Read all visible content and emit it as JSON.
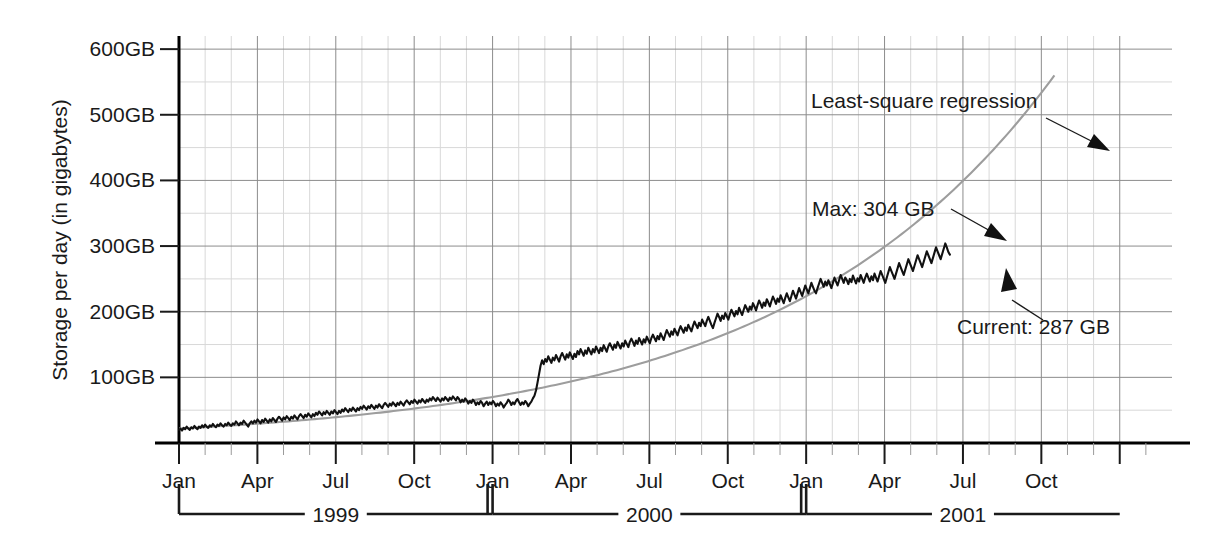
{
  "chart_data": {
    "type": "line",
    "title": "",
    "xlabel": "",
    "ylabel": "Storage per day (in gigabytes)",
    "ylim": [
      0,
      620
    ],
    "xlim": [
      0,
      38
    ],
    "grid": "major and minor gridlines",
    "legend_position": "inline annotations",
    "y_ticks": [
      {
        "value": 100,
        "label": "100GB"
      },
      {
        "value": 200,
        "label": "200GB"
      },
      {
        "value": 300,
        "label": "300GB"
      },
      {
        "value": 400,
        "label": "400GB"
      },
      {
        "value": 500,
        "label": "500GB"
      },
      {
        "value": 600,
        "label": "600GB"
      }
    ],
    "y_minor_ticks": [
      50,
      150,
      250,
      350,
      450,
      550
    ],
    "x_ticks": [
      {
        "index": 0,
        "label": "Jan",
        "year": 1999
      },
      {
        "index": 3,
        "label": "Apr",
        "year": 1999
      },
      {
        "index": 6,
        "label": "Jul",
        "year": 1999
      },
      {
        "index": 9,
        "label": "Oct",
        "year": 1999
      },
      {
        "index": 12,
        "label": "Jan",
        "year": 2000
      },
      {
        "index": 15,
        "label": "Apr",
        "year": 2000
      },
      {
        "index": 18,
        "label": "Jul",
        "year": 2000
      },
      {
        "index": 21,
        "label": "Oct",
        "year": 2000
      },
      {
        "index": 24,
        "label": "Jan",
        "year": 2001
      },
      {
        "index": 27,
        "label": "Apr",
        "year": 2001
      },
      {
        "index": 30,
        "label": "Jul",
        "year": 2001
      },
      {
        "index": 33,
        "label": "Oct",
        "year": 2001
      }
    ],
    "year_brackets": [
      {
        "label": "1999",
        "start_index": 0,
        "end_index": 12
      },
      {
        "label": "2000",
        "start_index": 12,
        "end_index": 24
      },
      {
        "label": "2001",
        "start_index": 24,
        "end_index": 36
      }
    ],
    "series": [
      {
        "name": "Storage per day",
        "style": "noisy black line",
        "color": "#111111",
        "values": [
          20,
          22,
          19,
          23,
          21,
          25,
          22,
          20,
          24,
          22,
          26,
          23,
          21,
          25,
          23,
          27,
          24,
          28,
          25,
          23,
          27,
          25,
          29,
          26,
          24,
          28,
          26,
          30,
          27,
          25,
          29,
          27,
          31,
          28,
          26,
          30,
          28,
          33,
          30,
          27,
          31,
          29,
          34,
          31,
          28,
          25,
          30,
          33,
          30,
          34,
          31,
          36,
          33,
          30,
          35,
          32,
          37,
          34,
          31,
          36,
          33,
          38,
          35,
          32,
          37,
          40,
          37,
          34,
          39,
          36,
          41,
          38,
          35,
          40,
          37,
          42,
          39,
          36,
          41,
          44,
          41,
          38,
          43,
          40,
          45,
          42,
          39,
          44,
          41,
          46,
          43,
          48,
          45,
          42,
          47,
          44,
          49,
          46,
          43,
          48,
          45,
          50,
          47,
          44,
          49,
          46,
          51,
          48,
          53,
          50,
          47,
          52,
          49,
          54,
          51,
          48,
          53,
          50,
          55,
          52,
          57,
          54,
          51,
          56,
          53,
          58,
          55,
          52,
          57,
          54,
          59,
          56,
          53,
          58,
          61,
          58,
          55,
          60,
          57,
          62,
          59,
          56,
          61,
          58,
          63,
          60,
          57,
          62,
          65,
          62,
          59,
          64,
          61,
          66,
          63,
          60,
          65,
          62,
          67,
          64,
          61,
          66,
          63,
          68,
          65,
          70,
          67,
          64,
          69,
          66,
          63,
          68,
          65,
          70,
          67,
          64,
          69,
          66,
          71,
          68,
          65,
          70,
          67,
          62,
          66,
          63,
          68,
          65,
          60,
          64,
          61,
          66,
          63,
          58,
          62,
          59,
          64,
          61,
          56,
          60,
          63,
          58,
          62,
          59,
          64,
          61,
          56,
          60,
          57,
          62,
          59,
          54,
          58,
          61,
          66,
          63,
          58,
          62,
          59,
          64,
          67,
          62,
          58,
          62,
          59,
          64,
          61,
          56,
          60,
          63,
          68,
          72,
          80,
          92,
          105,
          118,
          126,
          120,
          128,
          124,
          132,
          127,
          122,
          130,
          126,
          134,
          129,
          124,
          132,
          137,
          132,
          127,
          135,
          130,
          138,
          133,
          128,
          136,
          131,
          140,
          135,
          143,
          138,
          133,
          141,
          136,
          145,
          140,
          135,
          143,
          138,
          147,
          142,
          137,
          145,
          140,
          149,
          144,
          139,
          147,
          152,
          147,
          142,
          150,
          145,
          154,
          149,
          144,
          152,
          147,
          156,
          151,
          146,
          154,
          159,
          154,
          148,
          156,
          151,
          160,
          155,
          150,
          158,
          153,
          162,
          157,
          152,
          160,
          165,
          160,
          155,
          163,
          158,
          167,
          162,
          157,
          165,
          172,
          167,
          162,
          170,
          165,
          174,
          169,
          164,
          172,
          178,
          173,
          168,
          176,
          171,
          180,
          175,
          170,
          178,
          185,
          180,
          175,
          183,
          178,
          188,
          183,
          178,
          186,
          192,
          186,
          180,
          175,
          183,
          190,
          197,
          192,
          186,
          194,
          189,
          198,
          193,
          188,
          196,
          203,
          198,
          193,
          201,
          196,
          206,
          200,
          195,
          203,
          210,
          205,
          200,
          208,
          203,
          213,
          208,
          202,
          210,
          217,
          212,
          206,
          214,
          209,
          219,
          214,
          208,
          216,
          223,
          218,
          212,
          220,
          215,
          225,
          219,
          213,
          221,
          228,
          222,
          216,
          224,
          232,
          226,
          220,
          228,
          236,
          230,
          224,
          232,
          240,
          234,
          228,
          236,
          244,
          238,
          232,
          228,
          236,
          243,
          250,
          244,
          238,
          246,
          240,
          248,
          242,
          236,
          244,
          252,
          246,
          240,
          248,
          256,
          250,
          244,
          252,
          248,
          242,
          250,
          245,
          255,
          249,
          243,
          251,
          246,
          256,
          250,
          244,
          252,
          258,
          252,
          246,
          254,
          248,
          258,
          252,
          246,
          254,
          262,
          256,
          250,
          244,
          252,
          260,
          268,
          262,
          256,
          250,
          258,
          266,
          274,
          268,
          262,
          256,
          264,
          272,
          280,
          274,
          268,
          262,
          270,
          278,
          286,
          280,
          274,
          268,
          276,
          284,
          292,
          286,
          280,
          274,
          282,
          290,
          298,
          292,
          286,
          280,
          288,
          296,
          304,
          298,
          291,
          287
        ]
      },
      {
        "name": "Least-square regression",
        "style": "smooth grey curve",
        "color": "#9d9d9d",
        "description": "exponential fit rising from ~22GB at Jan 1999 to ~560GB at Oct 2001"
      }
    ],
    "annotations": [
      {
        "name": "regression-annotation",
        "text": "Least-square regression",
        "points_to": "grey regression curve near Aug 2001"
      },
      {
        "name": "max-annotation",
        "text": "Max: 304 GB",
        "value": 304,
        "unit": "GB",
        "points_to": "peak of black series near Jun 2001"
      },
      {
        "name": "current-annotation",
        "text": "Current: 287 GB",
        "value": 287,
        "unit": "GB",
        "points_to": "last point of black series near Jun 2001"
      }
    ]
  },
  "colors": {
    "series": "#111111",
    "regression": "#9d9d9d",
    "grid_major": "#8c8c8c",
    "grid_minor": "#d8d8d8",
    "axis": "#000000",
    "text": "#1a1a1a",
    "background": "#ffffff"
  }
}
